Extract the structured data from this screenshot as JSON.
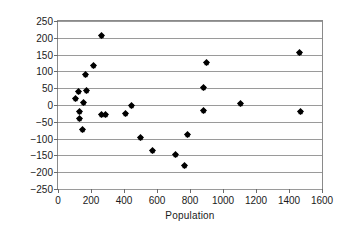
{
  "chart_data": {
    "type": "scatter",
    "title": "",
    "xlabel": "Population",
    "ylabel": "Residual Rooms",
    "xlim": [
      0,
      1600
    ],
    "ylim": [
      -250,
      250
    ],
    "xticks": [
      0,
      200,
      400,
      600,
      800,
      1000,
      1200,
      1400,
      1600
    ],
    "yticks": [
      -250,
      -200,
      -150,
      -100,
      -50,
      0,
      50,
      100,
      150,
      200,
      250
    ],
    "xtick_labels": [
      "0",
      "200",
      "400",
      "600",
      "800",
      "1000",
      "1200",
      "1400",
      "1600"
    ],
    "ytick_labels": [
      "−250",
      "−200",
      "−150",
      "−100",
      "−50",
      "0",
      "50",
      "100",
      "150",
      "200",
      "250"
    ],
    "grid": "horizontal",
    "legend": "none",
    "marker": "diamond",
    "marker_color": "#000000",
    "points": [
      {
        "x": 105,
        "y": 18
      },
      {
        "x": 122,
        "y": 40
      },
      {
        "x": 128,
        "y": -18
      },
      {
        "x": 132,
        "y": -40
      },
      {
        "x": 148,
        "y": -73
      },
      {
        "x": 155,
        "y": 7
      },
      {
        "x": 168,
        "y": 92
      },
      {
        "x": 172,
        "y": 42
      },
      {
        "x": 215,
        "y": 118
      },
      {
        "x": 262,
        "y": 208
      },
      {
        "x": 266,
        "y": -28
      },
      {
        "x": 286,
        "y": -28
      },
      {
        "x": 410,
        "y": -24
      },
      {
        "x": 443,
        "y": -1
      },
      {
        "x": 498,
        "y": -97
      },
      {
        "x": 572,
        "y": -134
      },
      {
        "x": 712,
        "y": -146
      },
      {
        "x": 768,
        "y": -181
      },
      {
        "x": 782,
        "y": -89
      },
      {
        "x": 880,
        "y": 53
      },
      {
        "x": 884,
        "y": -17
      },
      {
        "x": 898,
        "y": 126
      },
      {
        "x": 1104,
        "y": 3
      },
      {
        "x": 1466,
        "y": 157
      },
      {
        "x": 1470,
        "y": -18
      }
    ]
  }
}
